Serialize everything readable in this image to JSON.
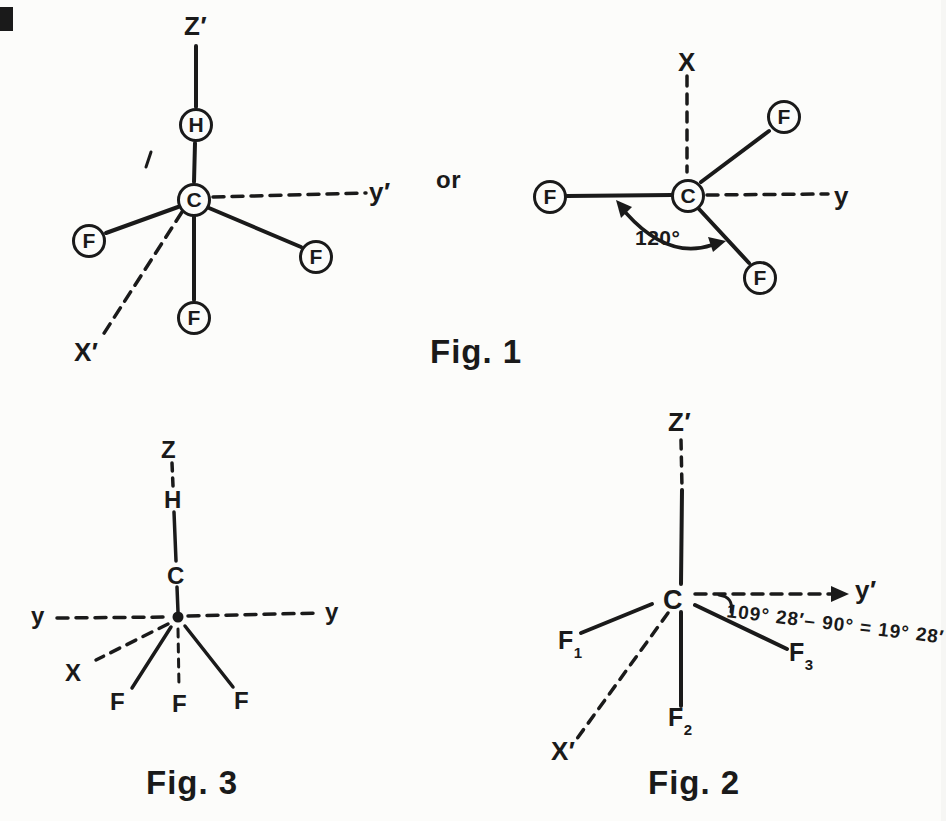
{
  "colors": {
    "ink": "#1a1a1a",
    "paper": "#fcfcfa"
  },
  "fig1": {
    "label": "Fig. 1",
    "or_text": "or",
    "left": {
      "axis_top": "Z′",
      "axis_right": "y′",
      "axis_lower_left": "X′",
      "atom_top": "H",
      "atom_center": "C",
      "atom_left": "F",
      "atom_right": "F",
      "atom_bottom": "F"
    },
    "right": {
      "axis_top": "X",
      "axis_right": "y",
      "atom_center": "C",
      "atom_upper_right": "F",
      "atom_left": "F",
      "atom_lower_right": "F",
      "angle_label": "120°"
    }
  },
  "fig2": {
    "label": "Fig. 2",
    "axis_top": "Z′",
    "axis_right": "y′",
    "axis_lower_left": "X′",
    "atom_center": "C",
    "angle_annotation": "109° 28′– 90° = 19° 28′",
    "f1": {
      "base": "F",
      "sub": "1"
    },
    "f2": {
      "base": "F",
      "sub": "2"
    },
    "f3": {
      "base": "F",
      "sub": "3"
    }
  },
  "fig3": {
    "label": "Fig. 3",
    "axis_top": "Z",
    "axis_left": "y",
    "axis_right": "y",
    "axis_lower_left": "X",
    "atom_top": "H",
    "atom_center": "C",
    "f_left": "F",
    "f_middle": "F",
    "f_right": "F"
  }
}
